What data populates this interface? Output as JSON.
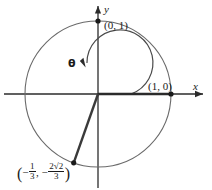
{
  "figure": {
    "background_color": "#ffffff",
    "stroke_color": "#3a3a3a",
    "axis_color": "#2b2b2b",
    "text_color": "#1a1a1a",
    "axes": {
      "x_label": "x",
      "y_label": "y"
    },
    "points": [
      {
        "name": "top-point",
        "label": "(0, 1)",
        "x": 0,
        "y": 1
      },
      {
        "name": "right-point",
        "label": "(1, 0)",
        "x": 1,
        "y": 0
      },
      {
        "name": "terminal-point",
        "x": -0.3333,
        "y": -0.9428
      }
    ],
    "terminal_point_label": {
      "open_paren": "(",
      "x_sign": "−",
      "x_numerator": "1",
      "x_denominator": "3",
      "comma": ",",
      "y_sign": "−",
      "y_numerator": "2√2",
      "y_denominator": "3",
      "close_paren": ")"
    },
    "angle": {
      "symbol": "θ",
      "start_degrees": 0,
      "end_degrees": 250.5,
      "direction": "counterclockwise",
      "arc_radius_px": 33
    },
    "geometry": {
      "origin_x": 98,
      "origin_y": 94,
      "unit_radius_px": 73
    }
  }
}
